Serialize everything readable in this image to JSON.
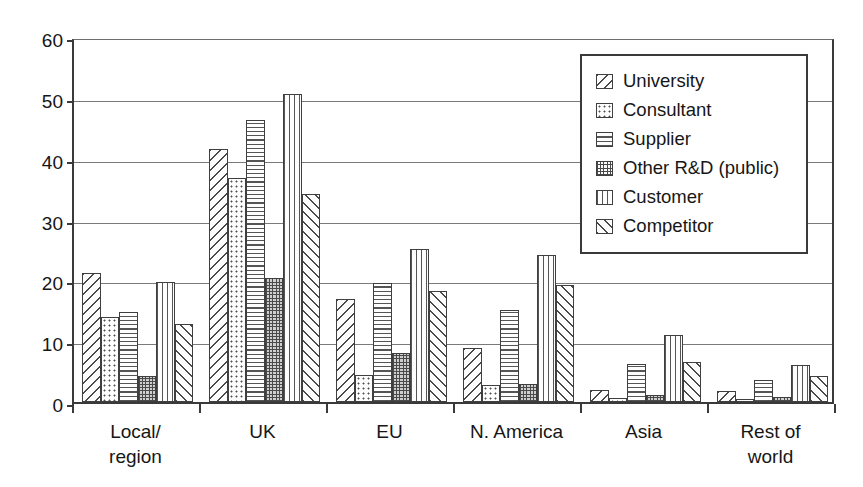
{
  "chart_data": {
    "type": "bar",
    "title": "",
    "subtitle": "",
    "xlabel": "",
    "ylabel": "",
    "ylim": [
      0,
      60
    ],
    "ytick_step": 10,
    "yticks": [
      "0",
      "10",
      "20",
      "30",
      "40",
      "50",
      "60"
    ],
    "grid": true,
    "legend_position": "top-right",
    "categories": [
      "Local/\nregion",
      "UK",
      "EU",
      "N. America",
      "Asia",
      "Rest of\nworld"
    ],
    "category_plain": [
      "Local/region",
      "UK",
      "EU",
      "N. America",
      "Asia",
      "Rest of world"
    ],
    "series": [
      {
        "name": "University",
        "pattern": "diagonal-backslash",
        "values": [
          21.2,
          41.6,
          16.9,
          8.8,
          1.9,
          1.8
        ]
      },
      {
        "name": "Consultant",
        "pattern": "dotted",
        "values": [
          13.9,
          36.8,
          4.5,
          2.8,
          0.7,
          0.5
        ]
      },
      {
        "name": "Supplier",
        "pattern": "horizontal-lines",
        "values": [
          14.8,
          46.4,
          19.6,
          15.2,
          6.2,
          3.7
        ]
      },
      {
        "name": "Other R&D (public)",
        "pattern": "crosshatch-grid",
        "values": [
          4.2,
          20.4,
          8.1,
          3.0,
          1.1,
          0.9
        ]
      },
      {
        "name": "Customer",
        "pattern": "vertical-lines",
        "values": [
          19.7,
          50.7,
          25.1,
          24.1,
          11.0,
          6.1
        ]
      },
      {
        "name": "Competitor",
        "pattern": "diagonal-slash",
        "values": [
          12.9,
          34.2,
          18.3,
          19.2,
          6.5,
          4.3
        ]
      }
    ]
  },
  "legend": {
    "items": [
      {
        "label": "University"
      },
      {
        "label": "Consultant"
      },
      {
        "label": "Supplier"
      },
      {
        "label": "Other R&D (public)"
      },
      {
        "label": "Customer"
      },
      {
        "label": "Competitor"
      }
    ]
  },
  "colors": {
    "background": "#ffffff",
    "axis": "#3a3a3a",
    "gridline": "#7a7a7a",
    "bar_outline": "#3f3f3f",
    "hatch": "#4a4a4a",
    "text": "#161616"
  }
}
